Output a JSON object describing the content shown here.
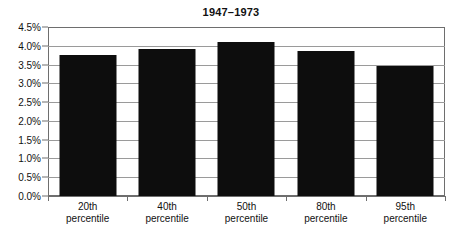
{
  "chart_data": {
    "type": "bar",
    "title": "1947–1973",
    "xlabel": "",
    "ylabel": "",
    "categories": [
      "20th percentile",
      "40th percentile",
      "50th percentile",
      "80th percentile",
      "95th percentile"
    ],
    "category_lines": [
      [
        "20th",
        "percentile"
      ],
      [
        "40th",
        "percentile"
      ],
      [
        "50th",
        "percentile"
      ],
      [
        "80th",
        "percentile"
      ],
      [
        "95th",
        "percentile"
      ]
    ],
    "values": [
      3.75,
      3.92,
      4.1,
      3.85,
      3.45
    ],
    "ylim": [
      0.0,
      4.5
    ],
    "ytick_step": 0.5,
    "ytick_labels": [
      "4.5%",
      "4.0%",
      "3.5%",
      "3.0%",
      "2.5%",
      "2.0%",
      "1.5%",
      "1.0%",
      "0.5%",
      "0.0%"
    ],
    "ytick_values": [
      4.5,
      4.0,
      3.5,
      3.0,
      2.5,
      2.0,
      1.5,
      1.0,
      0.5,
      0.0
    ],
    "grid": true,
    "legend": false,
    "legend_position": "none",
    "bar_color": "#0d0d0d",
    "grid_color": "#9a9a9a",
    "axis_color": "#6e6e6e",
    "background_color": "#ffffff",
    "text_color": "#111111"
  }
}
